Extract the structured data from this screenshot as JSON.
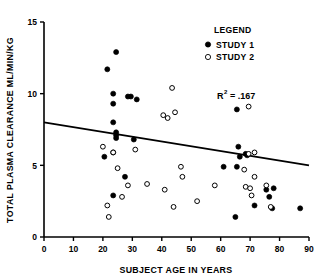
{
  "chart_data": {
    "type": "scatter",
    "title": "",
    "xlabel": "SUBJECT AGE IN YEARS",
    "ylabel": "TOTAL PLASMA CLEARANCE ML/MIN/KG",
    "xlim": [
      0,
      90
    ],
    "ylim": [
      0,
      15
    ],
    "xticks": [
      0,
      10,
      20,
      30,
      40,
      50,
      60,
      70,
      80,
      90
    ],
    "xtick_labels": [
      "0",
      "10",
      "20",
      "30",
      "40",
      "50",
      "60",
      "70",
      "80",
      "90"
    ],
    "yticks": [
      0,
      5,
      10,
      15
    ],
    "ytick_labels": [
      "0",
      "5",
      "10",
      "15"
    ],
    "grid": false,
    "legend": {
      "title": "LEGEND",
      "position": "top-right",
      "entries": [
        {
          "label": "STUDY 1",
          "marker": "filled-circle",
          "color": "#000000"
        },
        {
          "label": "STUDY 2",
          "marker": "open-circle",
          "color": "#000000"
        }
      ]
    },
    "annotations": [
      {
        "name": "r-squared",
        "text": "R2 = .167",
        "base": "R",
        "superscript": "2",
        "rest": "=  .167",
        "x": 64,
        "y": 9.9
      }
    ],
    "trendline": {
      "name": "regression-line",
      "x_start": 0,
      "y_start": 8.0,
      "x_end": 90,
      "y_end": 5.0,
      "color": "#000000",
      "width": 1.8
    },
    "series": [
      {
        "name": "STUDY 1",
        "marker": "filled-circle",
        "color": "#000000",
        "points": [
          [
            24.5,
            12.9
          ],
          [
            21.5,
            11.7
          ],
          [
            23.5,
            10.0
          ],
          [
            23.5,
            9.3
          ],
          [
            28.5,
            9.8
          ],
          [
            29.5,
            9.8
          ],
          [
            31.5,
            9.6
          ],
          [
            65.5,
            8.9
          ],
          [
            23.5,
            8.0
          ],
          [
            24.5,
            7.3
          ],
          [
            24.5,
            7.1
          ],
          [
            24.5,
            6.9
          ],
          [
            30.5,
            6.8
          ],
          [
            66.0,
            6.3
          ],
          [
            68.5,
            5.8
          ],
          [
            69.0,
            5.7
          ],
          [
            66.5,
            5.6
          ],
          [
            20.5,
            5.6
          ],
          [
            23.5,
            5.9
          ],
          [
            61.0,
            4.9
          ],
          [
            65.5,
            4.9
          ],
          [
            27.5,
            4.2
          ],
          [
            75.5,
            3.3
          ],
          [
            78.0,
            3.4
          ],
          [
            76.5,
            2.8
          ],
          [
            23.5,
            2.9
          ],
          [
            71.5,
            2.2
          ],
          [
            77.5,
            2.0
          ],
          [
            65.0,
            1.4
          ],
          [
            87.0,
            2.0
          ]
        ]
      },
      {
        "name": "STUDY 2",
        "marker": "open-circle",
        "color": "#000000",
        "points": [
          [
            43.5,
            10.4
          ],
          [
            69.5,
            9.1
          ],
          [
            44.5,
            8.7
          ],
          [
            40.5,
            8.5
          ],
          [
            42.0,
            8.3
          ],
          [
            20.0,
            6.3
          ],
          [
            23.5,
            5.9
          ],
          [
            71.5,
            5.9
          ],
          [
            69.5,
            5.8
          ],
          [
            31.0,
            6.1
          ],
          [
            25.0,
            4.8
          ],
          [
            46.5,
            4.9
          ],
          [
            68.0,
            4.7
          ],
          [
            47.0,
            4.2
          ],
          [
            71.5,
            4.2
          ],
          [
            28.5,
            3.6
          ],
          [
            35.0,
            3.7
          ],
          [
            58.0,
            3.6
          ],
          [
            68.5,
            3.5
          ],
          [
            70.0,
            3.4
          ],
          [
            75.5,
            3.6
          ],
          [
            41.0,
            3.3
          ],
          [
            70.5,
            2.9
          ],
          [
            26.5,
            2.8
          ],
          [
            52.0,
            2.5
          ],
          [
            44.0,
            2.1
          ],
          [
            21.5,
            2.2
          ],
          [
            77.0,
            2.1
          ],
          [
            22.0,
            1.4
          ]
        ]
      }
    ]
  }
}
